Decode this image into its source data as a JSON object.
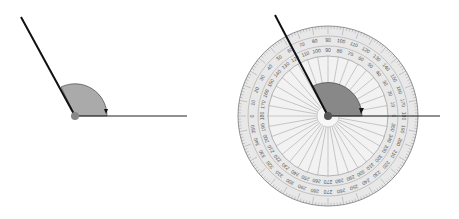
{
  "figure": {
    "left_diagram": {
      "description": "Obtuse angle with shaded arc and arrow",
      "angle_degrees": 117,
      "colors": {
        "line": "#111111",
        "arc_fill": "#aaaaaa",
        "vertex": "#888888"
      }
    },
    "right_diagram": {
      "description": "Same angle measured with a 360-degree protractor",
      "outer_scale_labels": [
        "0",
        "10",
        "20",
        "30",
        "40",
        "50",
        "60",
        "70",
        "80",
        "90",
        "100",
        "110",
        "120",
        "130",
        "140",
        "150",
        "160",
        "170",
        "180",
        "190",
        "200",
        "210",
        "220",
        "230",
        "240",
        "250",
        "260",
        "270",
        "280",
        "290",
        "300",
        "310",
        "320",
        "330",
        "340",
        "350"
      ],
      "colors": {
        "protractor": "#e6e6e6",
        "arc_fill": "#888888",
        "line": "#111111"
      }
    }
  }
}
